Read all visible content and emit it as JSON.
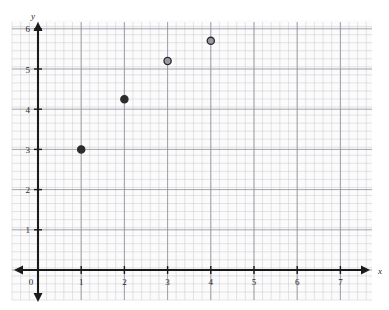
{
  "chart_data": {
    "type": "scatter",
    "title": "",
    "subtitle": "",
    "xlabel": "x",
    "ylabel": "y",
    "xlim": [
      0,
      7
    ],
    "ylim": [
      0,
      6
    ],
    "xticks": [
      "0",
      "1",
      "2",
      "3",
      "4",
      "5",
      "6",
      "7"
    ],
    "yticks": [
      "0",
      "1",
      "2",
      "3",
      "4",
      "5",
      "6"
    ],
    "x_tick_values": [
      0,
      1,
      2,
      3,
      4,
      5,
      6,
      7
    ],
    "y_tick_values": [
      0,
      1,
      2,
      3,
      4,
      5,
      6
    ],
    "grid": true,
    "grid_style": "graph-paper",
    "grid_minor_step": 0.2,
    "legend": "none",
    "origin_label": "0",
    "series": [
      {
        "name": "data",
        "marker": "circle",
        "color": "#2b2b2b",
        "points": [
          {
            "x": 1,
            "y": 3,
            "filled": true
          },
          {
            "x": 2,
            "y": 4.25,
            "filled": true
          },
          {
            "x": 3,
            "y": 5.2,
            "filled": false
          },
          {
            "x": 4,
            "y": 5.7,
            "filled": false
          }
        ]
      }
    ],
    "x": [
      1,
      2,
      3,
      4
    ],
    "values": [
      3,
      4.25,
      5.2,
      5.7
    ],
    "annotations": []
  },
  "axes": {
    "x_name": "x",
    "y_name": "y",
    "origin": "0",
    "x_arrow": "both",
    "y_arrow": "both"
  },
  "colors": {
    "axis": "#1a1a1a",
    "grid_major": "#8e8e98",
    "grid_minor": "#c9c9cf",
    "marker": "#2b2b2b",
    "paper": "#fbfbfb",
    "background": "#ffffff"
  }
}
